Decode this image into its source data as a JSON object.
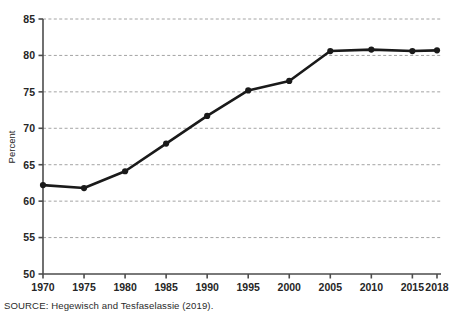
{
  "chart_data": {
    "type": "line",
    "title": "",
    "subtitle": "",
    "xlabel": "",
    "ylabel": "Percent",
    "x": [
      1970,
      1975,
      1980,
      1985,
      1990,
      1995,
      2000,
      2005,
      2010,
      2015,
      2018
    ],
    "xticklabels": [
      "1970",
      "1975",
      "1980",
      "1985",
      "1990",
      "1995",
      "2000",
      "2005",
      "2010",
      "2015",
      "2018"
    ],
    "values": [
      62.2,
      61.8,
      64.1,
      67.9,
      71.7,
      75.2,
      76.5,
      80.6,
      80.8,
      80.6,
      80.7
    ],
    "series": [
      {
        "name": "Percent",
        "values": [
          62.2,
          61.8,
          64.1,
          67.9,
          71.7,
          75.2,
          76.5,
          80.6,
          80.8,
          80.6,
          80.7
        ]
      }
    ],
    "ylim": [
      50,
      85
    ],
    "yticks": [
      50,
      55,
      60,
      65,
      70,
      75,
      80,
      85
    ],
    "yticklabels": [
      "50",
      "55",
      "60",
      "65",
      "70",
      "75",
      "80",
      "85"
    ],
    "grid": "horizontal-dashed",
    "legend": "none",
    "marker": "filled-circle",
    "line_color": "#1a1a1a",
    "grid_color": "#9a9a9a",
    "axis_color": "#4d4d4d",
    "background_color": "#ffffff"
  },
  "source": {
    "note": "SOURCE: Hegewisch and Tesfaselassie (2019)."
  }
}
